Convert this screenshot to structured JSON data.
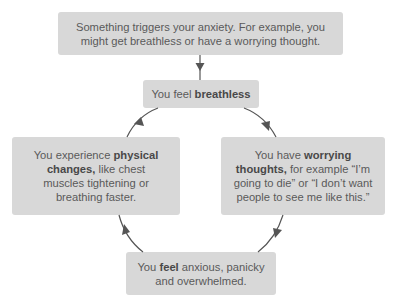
{
  "diagram": {
    "type": "cycle-flowchart",
    "colors": {
      "box_fill": "#d8d8d8",
      "text": "#5a5a5a",
      "bold_text": "#484848",
      "arrow": "#555555",
      "background": "#ffffff"
    },
    "nodes": {
      "trigger": {
        "line1": "Something triggers your anxiety. For example, you",
        "line2": "might get breathless or have a worrying thought."
      },
      "breathless": {
        "prefix": "You feel ",
        "bold": "breathless"
      },
      "physical": {
        "prefix": "You experience ",
        "bold": "physical changes,",
        "suffix": " like chest muscles tightening or breathing faster."
      },
      "worrying": {
        "prefix": "You have ",
        "bold": "worrying thoughts,",
        "suffix": " for example “I’m going to die” or “I don’t want people to see me like this.”"
      },
      "anxious": {
        "prefix": "You ",
        "bold": "feel",
        "suffix": " anxious, panicky and overwhelmed."
      }
    },
    "edges": [
      {
        "from": "trigger",
        "to": "breathless"
      },
      {
        "from": "breathless",
        "to": "worrying"
      },
      {
        "from": "worrying",
        "to": "anxious"
      },
      {
        "from": "anxious",
        "to": "physical"
      },
      {
        "from": "physical",
        "to": "breathless"
      }
    ]
  }
}
